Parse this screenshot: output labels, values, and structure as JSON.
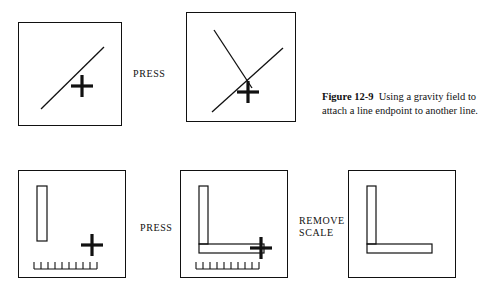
{
  "figure": {
    "number": "Figure 12-9",
    "caption_text": "Using a gravity field to attach a line endpoint to another line.",
    "ink_color": "#111111",
    "background_color": "#ffffff"
  },
  "labels": {
    "press_1": "PRESS",
    "press_2": "PRESS",
    "remove_scale": "REMOVE\nSCALE"
  },
  "panels": [
    {
      "id": "panel-r1c1",
      "name": "panel-line-with-cursor",
      "contents": [
        "diagonal-line",
        "crosshair-cursor"
      ]
    },
    {
      "id": "panel-r1c2",
      "name": "panel-two-lines-joined",
      "contents": [
        "diagonal-line",
        "second-line",
        "crosshair-cursor"
      ]
    },
    {
      "id": "panel-r2c1",
      "name": "panel-vertical-bar-with-scale",
      "contents": [
        "vertical-bar",
        "ruler-scale",
        "crosshair-cursor"
      ]
    },
    {
      "id": "panel-r2c2",
      "name": "panel-bar-attached-to-scale",
      "contents": [
        "vertical-bar",
        "horizontal-bar",
        "ruler-scale",
        "crosshair-cursor"
      ]
    },
    {
      "id": "panel-r2c3",
      "name": "panel-lshape-result",
      "contents": [
        "vertical-bar",
        "horizontal-bar"
      ]
    }
  ]
}
